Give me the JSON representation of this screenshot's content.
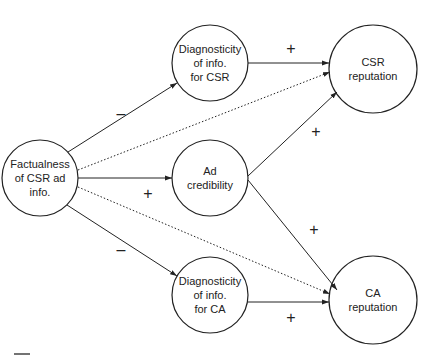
{
  "nodes": {
    "factualness": {
      "label": "Factualness\nof CSR ad\ninfo.",
      "cx": 40,
      "cy": 178,
      "r": 38
    },
    "diag_csr": {
      "label": "Diagnosticity\nof info.\nfor CSR",
      "cx": 210,
      "cy": 63,
      "r": 38
    },
    "ad_cred": {
      "label": "Ad\ncredibility",
      "cx": 210,
      "cy": 178,
      "r": 38
    },
    "diag_ca": {
      "label": "Diagnosticity\nof info.\nfor CA",
      "cx": 210,
      "cy": 295,
      "r": 38
    },
    "csr_rep": {
      "label": "CSR\nreputation",
      "cx": 373,
      "cy": 69,
      "r": 44
    },
    "ca_rep": {
      "label": "CA\nreputation",
      "cx": 373,
      "cy": 300,
      "r": 44
    }
  },
  "edges": [
    {
      "from": "factualness",
      "to": "diag_csr",
      "style": "solid",
      "sign": "–"
    },
    {
      "from": "factualness",
      "to": "ad_cred",
      "style": "solid",
      "sign": "+"
    },
    {
      "from": "factualness",
      "to": "diag_ca",
      "style": "solid",
      "sign": "–"
    },
    {
      "from": "factualness",
      "to": "csr_rep",
      "style": "dotted",
      "sign": ""
    },
    {
      "from": "factualness",
      "to": "ca_rep",
      "style": "dotted",
      "sign": ""
    },
    {
      "from": "diag_csr",
      "to": "csr_rep",
      "style": "solid",
      "sign": "+"
    },
    {
      "from": "ad_cred",
      "to": "csr_rep",
      "style": "solid",
      "sign": "+"
    },
    {
      "from": "ad_cred",
      "to": "ca_rep",
      "style": "solid",
      "sign": "+"
    },
    {
      "from": "diag_ca",
      "to": "ca_rep",
      "style": "solid",
      "sign": "+"
    }
  ],
  "signs": {
    "fact_diagcsr": "–",
    "fact_adcred": "+",
    "fact_diagca": "–",
    "diagcsr_csrrep": "+",
    "adcred_csrrep": "+",
    "adcred_carep": "+",
    "diagca_carep": "+"
  }
}
